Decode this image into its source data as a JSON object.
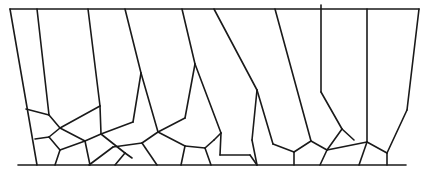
{
  "diagram": {
    "type": "grain-structure-line-drawing",
    "stroke_color": "#1a1a1a",
    "background": "#ffffff",
    "boundaries": {
      "top": [
        [
          10,
          9
        ],
        [
          419,
          9
        ]
      ],
      "bottom": [
        [
          18,
          165
        ],
        [
          406,
          165
        ]
      ]
    },
    "segments": [
      [
        10,
        9,
        37,
        165
      ],
      [
        37,
        9,
        49,
        115
      ],
      [
        26,
        109,
        49,
        115
      ],
      [
        49,
        115,
        60,
        128
      ],
      [
        60,
        128,
        100,
        106
      ],
      [
        88,
        9,
        100,
        106
      ],
      [
        100,
        106,
        101,
        134
      ],
      [
        60,
        128,
        85,
        141
      ],
      [
        35,
        139,
        49,
        137
      ],
      [
        49,
        137,
        60,
        128
      ],
      [
        49,
        137,
        60,
        150
      ],
      [
        60,
        150,
        55,
        165
      ],
      [
        60,
        150,
        85,
        141
      ],
      [
        85,
        141,
        90,
        165
      ],
      [
        85,
        141,
        101,
        134
      ],
      [
        101,
        134,
        125,
        153
      ],
      [
        125,
        153,
        132,
        158
      ],
      [
        89,
        165,
        113,
        147
      ],
      [
        113,
        147,
        142,
        143
      ],
      [
        115,
        165,
        125,
        153
      ],
      [
        101,
        134,
        133,
        122
      ],
      [
        133,
        122,
        141,
        73
      ],
      [
        125,
        9,
        141,
        73
      ],
      [
        141,
        73,
        158,
        132
      ],
      [
        158,
        132,
        185,
        118
      ],
      [
        185,
        118,
        195,
        64
      ],
      [
        182,
        9,
        195,
        64
      ],
      [
        195,
        64,
        221,
        133
      ],
      [
        158,
        132,
        142,
        143
      ],
      [
        158,
        132,
        185,
        146
      ],
      [
        142,
        143,
        157,
        165
      ],
      [
        185,
        146,
        181,
        165
      ],
      [
        185,
        146,
        205,
        148
      ],
      [
        205,
        148,
        214,
        140
      ],
      [
        205,
        148,
        211,
        165
      ],
      [
        221,
        133,
        220,
        155
      ],
      [
        220,
        155,
        250,
        155
      ],
      [
        250,
        155,
        257,
        165
      ],
      [
        221,
        133,
        214,
        140
      ],
      [
        214,
        9,
        257,
        90
      ],
      [
        257,
        90,
        252,
        140
      ],
      [
        257,
        90,
        273,
        144
      ],
      [
        252,
        140,
        257,
        165
      ],
      [
        273,
        144,
        294,
        152
      ],
      [
        294,
        152,
        294,
        165
      ],
      [
        294,
        152,
        311,
        141
      ],
      [
        275,
        9,
        311,
        141
      ],
      [
        311,
        141,
        327,
        150
      ],
      [
        321,
        5,
        321,
        92
      ],
      [
        321,
        92,
        342,
        129
      ],
      [
        342,
        129,
        327,
        150
      ],
      [
        342,
        129,
        354,
        140
      ],
      [
        327,
        150,
        320,
        165
      ],
      [
        327,
        150,
        367,
        142
      ],
      [
        367,
        142,
        359,
        165
      ],
      [
        367,
        142,
        367,
        9
      ],
      [
        367,
        142,
        387,
        153
      ],
      [
        387,
        153,
        387,
        165
      ],
      [
        387,
        153,
        407,
        110
      ],
      [
        407,
        110,
        419,
        9
      ]
    ]
  }
}
